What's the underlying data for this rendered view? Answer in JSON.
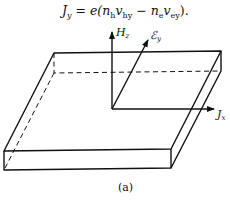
{
  "equation": {
    "lhs": "J",
    "lhs_sub": "y",
    "equals": " = ",
    "e": "e(",
    "n_h": "n",
    "n_h_sub": "h",
    "v_hy": "v",
    "v_hy_sub": "hy",
    "minus": " − ",
    "n_e": "n",
    "n_e_sub": "e",
    "v_ey": "v",
    "v_ey_sub": "ey",
    "close": ")."
  },
  "labels": {
    "hz": "H",
    "hz_sub": "z",
    "ey": "ℰ",
    "ey_sub": "y",
    "jx": "J",
    "jx_sub": "x"
  },
  "caption": "(a)",
  "colors": {
    "line": "#111111",
    "background": "#ffffff"
  }
}
